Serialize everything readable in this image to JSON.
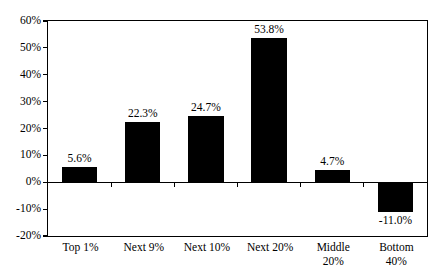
{
  "chart_data": {
    "type": "bar",
    "title": "",
    "subtitle": "",
    "xlabel": "",
    "ylabel": "",
    "categories": [
      "Top 1%",
      "Next 9%",
      "Next 10%",
      "Next 20%",
      "Middle\n20%",
      "Bottom\n40%"
    ],
    "values": [
      5.6,
      22.3,
      24.7,
      53.8,
      4.7,
      -11.0
    ],
    "data_labels": [
      "5.6%",
      "22.3%",
      "24.7%",
      "53.8%",
      "4.7%",
      "-11.0%"
    ],
    "ylim": [
      -20,
      60
    ],
    "ytick_values": [
      60,
      50,
      40,
      30,
      20,
      10,
      0,
      -10,
      -20
    ],
    "ytick_labels": [
      "60%",
      "50%",
      "40%",
      "30%",
      "20%",
      "10%",
      "0%",
      "-10%",
      "-20%"
    ],
    "grid": false,
    "legend": null,
    "bar_color": "#000000",
    "axis_color": "#000000",
    "background_color": "#FFFFFF"
  }
}
